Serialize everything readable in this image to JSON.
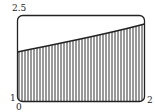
{
  "diagram": {
    "labels": {
      "y_top": "2.5",
      "x_left": "1",
      "y_bottom": "0",
      "x_right": "2"
    },
    "x_range": [
      1,
      2
    ],
    "y_range": [
      0,
      2.5
    ],
    "curve_points": [
      [
        1,
        1.44
      ],
      [
        1.25,
        1.66
      ],
      [
        1.5,
        1.85
      ],
      [
        1.75,
        2.03
      ],
      [
        2,
        2.21
      ]
    ],
    "fill": "vertical hatching",
    "colors": {
      "stroke": "#222222",
      "background": "#ffffff"
    }
  }
}
